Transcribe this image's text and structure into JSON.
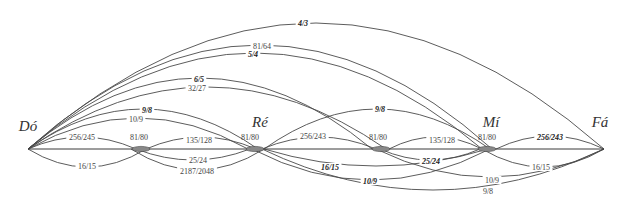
{
  "diagram": {
    "title": "",
    "nodes": [
      {
        "id": "do",
        "label": "Dó",
        "x": 28,
        "label_x": 28,
        "label_y": 131
      },
      {
        "id": "k1",
        "label": "",
        "x": 141
      },
      {
        "id": "re",
        "label": "Ré",
        "x": 258,
        "label_x": 260,
        "label_y": 127
      },
      {
        "id": "k2",
        "label": "",
        "x": 383
      },
      {
        "id": "mi",
        "label": "Mí",
        "x": 489,
        "label_x": 491,
        "label_y": 127
      },
      {
        "id": "fa",
        "label": "Fá",
        "x": 604,
        "label_x": 600,
        "label_y": 127
      }
    ],
    "baseline_y": 149,
    "arcs": [
      {
        "label": "4/3",
        "bold": true,
        "from": 28,
        "to": 604,
        "peak": 23,
        "lx": 303,
        "ly": 23
      },
      {
        "label": "81/64",
        "bold": false,
        "from": 28,
        "to": 492,
        "peak": 45,
        "lx": 262,
        "ly": 46
      },
      {
        "label": "5/4",
        "bold": true,
        "from": 28,
        "to": 482,
        "peak": 53,
        "lx": 253,
        "ly": 54
      },
      {
        "label": "6/5",
        "bold": true,
        "from": 28,
        "to": 372,
        "peak": 78,
        "lx": 199,
        "ly": 79
      },
      {
        "label": "32/27",
        "bold": false,
        "from": 28,
        "to": 386,
        "peak": 87,
        "lx": 197,
        "ly": 88
      },
      {
        "label": "9/8",
        "bold": true,
        "from": 28,
        "to": 258,
        "peak": 109,
        "lx": 147,
        "ly": 110
      },
      {
        "label": "10/9",
        "bold": false,
        "from": 28,
        "to": 248,
        "peak": 118,
        "lx": 136,
        "ly": 119
      },
      {
        "label": "256/245",
        "bold": false,
        "from": 28,
        "to": 136,
        "peak": 137,
        "lx": 82,
        "ly": 137
      },
      {
        "label": "16/15",
        "bold": false,
        "from": 28,
        "to": 146,
        "peak": 167,
        "lx": 87,
        "ly": 166
      },
      {
        "label": "135/128",
        "bold": false,
        "from": 146,
        "to": 256,
        "peak": 137,
        "lx": 199,
        "ly": 140
      },
      {
        "label": "25/24",
        "bold": false,
        "from": 136,
        "to": 250,
        "peak": 160,
        "lx": 198,
        "ly": 160
      },
      {
        "label": "2187/2048",
        "bold": false,
        "from": 131,
        "to": 264,
        "peak": 170,
        "lx": 197,
        "ly": 171
      },
      {
        "label": "256/243",
        "bold": false,
        "from": 262,
        "to": 376,
        "peak": 137,
        "lx": 313,
        "ly": 136
      },
      {
        "label": "9/8",
        "bold": true,
        "from": 264,
        "to": 490,
        "peak": 109,
        "lx": 380,
        "ly": 109
      },
      {
        "label": "135/128",
        "bold": false,
        "from": 389,
        "to": 482,
        "peak": 137,
        "lx": 442,
        "ly": 140
      },
      {
        "label": "16/15",
        "bold": true,
        "from": 264,
        "to": 488,
        "peak": 166,
        "lx": 330,
        "ly": 167
      },
      {
        "label": "25/24",
        "bold": true,
        "from": 380,
        "to": 480,
        "peak": 160,
        "lx": 431,
        "ly": 161
      },
      {
        "label": "10/9",
        "bold": true,
        "from": 252,
        "to": 490,
        "peak": 180,
        "lx": 370,
        "ly": 181
      },
      {
        "label": "9/8",
        "bold": false,
        "from": 262,
        "to": 604,
        "peak": 190,
        "lx": 488,
        "ly": 191
      },
      {
        "label": "10/9",
        "bold": false,
        "from": 376,
        "to": 604,
        "peak": 177,
        "lx": 492,
        "ly": 180
      },
      {
        "label": "16/15",
        "bold": false,
        "from": 482,
        "to": 604,
        "peak": 167,
        "lx": 541,
        "ly": 167
      },
      {
        "label": "256/243",
        "bold": true,
        "from": 496,
        "to": 604,
        "peak": 136,
        "lx": 550,
        "ly": 137
      }
    ],
    "knots": [
      {
        "label": "81/80",
        "x": 141,
        "lx": 139,
        "ly": 137
      },
      {
        "label": "81/80",
        "x": 255,
        "lx": 250,
        "ly": 137
      },
      {
        "label": "81/80",
        "x": 381,
        "lx": 378,
        "ly": 137
      },
      {
        "label": "81/80",
        "x": 487,
        "lx": 487,
        "ly": 137
      }
    ]
  }
}
